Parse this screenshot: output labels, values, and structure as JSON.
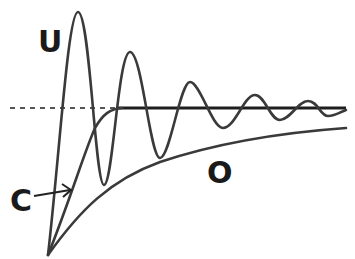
{
  "diagram": {
    "labels": {
      "underdamped": "U",
      "critically_damped": "C",
      "overdamped": "O"
    },
    "curves": [
      {
        "id": "underdamped",
        "label": "U",
        "description": "oscillating response decaying toward target"
      },
      {
        "id": "critically_damped",
        "label": "C",
        "description": "fastest approach to target without overshoot"
      },
      {
        "id": "overdamped",
        "label": "O",
        "description": "slow approach to target"
      }
    ],
    "reference_line": {
      "description": "target / equilibrium level",
      "style": "dashed then solid"
    },
    "colors": {
      "stroke": "#3a3a3a",
      "background": "#ffffff"
    }
  }
}
